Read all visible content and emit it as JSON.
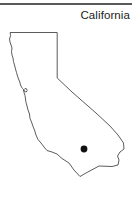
{
  "figure": {
    "kind": "state-outline-map",
    "background_color": "#ffffff",
    "width": 136,
    "height": 198
  },
  "header": {
    "title": "California",
    "title_color": "#1b1b1b",
    "rule_color": "#59595b"
  },
  "map": {
    "region_name": "California",
    "outline_color": "#4a4a4c",
    "fill_color": "#ffffff",
    "marker": {
      "name": "city-marker",
      "color": "#111111",
      "x": 84,
      "y": 149,
      "radius": 3.4
    },
    "outline_path": "M 10.5,32.5 L 57.2,32.5 L 57.2,78.0 L 72,92 L 96,113 L 110,126 L 118,135 L 123.5,143 L 124,149 L 120,152 L 117.5,156 L 119,160 L 118,165 L 112,166.5 L 99,166 L 86,173 L 80,176.5 L 74,170 L 69,163 L 62,158.5 L 57,154 L 52,152 L 47,150.5 L 44,147 L 41,143 L 38,139.5 L 36,135 L 34.5,130 L 33,126.5 L 31.5,122 L 30,118.5 L 29.5,114 L 28,110 L 27,106 L 26,102.5 L 25.5,99 L 25,95.5 L 24,92.5 L 23.5,90 L 25,88.5 L 26.5,88.8 L 27.2,90.5 L 26.2,92 L 24.6,91.6 L 23.8,89.8 L 22.5,88.5 L 21.5,87 L 20.5,85 L 19.8,82 L 18.5,79 L 17.5,76 L 16.5,72.5 L 15.5,69 L 14.5,65 L 13.5,61.5 L 13,58 L 12,55 L 11.5,51.5 L 12,48 L 11,45 L 10,42 L 9.5,39 L 10.5,36 Z"
  }
}
